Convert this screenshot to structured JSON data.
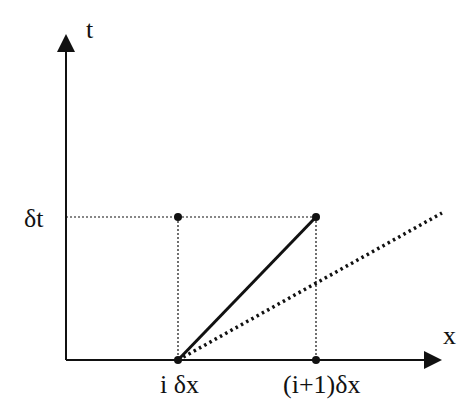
{
  "diagram": {
    "axes": {
      "vertical_label": "t",
      "horizontal_label": "x"
    },
    "tick_labels": {
      "dt": "δt",
      "i_dx": "i δx",
      "i1_dx": "(i+1)δx"
    },
    "lines": [
      {
        "name": "solid-characteristic",
        "style": "solid",
        "from": "i δx, 0",
        "to": "(i+1)δx, δt"
      },
      {
        "name": "dotted-characteristic",
        "style": "dotted",
        "from": "i δx, 0",
        "direction": "shallower slope"
      }
    ],
    "points": [
      "(i δx, δt)",
      "((i+1)δx, δt)",
      "(i δx, 0)",
      "((i+1)δx, 0)"
    ],
    "colors": {
      "ink": "#111111",
      "background": "#ffffff"
    }
  }
}
